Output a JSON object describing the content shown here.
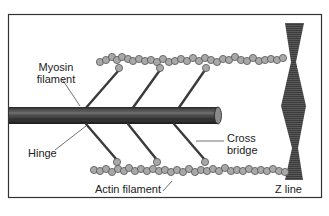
{
  "figure": {
    "labels": {
      "myosin_line1": "Myosin",
      "myosin_line2": "filament",
      "hinge": "Hinge",
      "cross_line1": "Cross",
      "cross_line2": "bridge",
      "actin": "Actin filament",
      "zline": "Z line"
    },
    "colors": {
      "frame": "#333333",
      "rod": "#3a3a3a",
      "rod_highlight": "#6a6a6a",
      "bead_fill": "#a8a8a8",
      "bead_stroke": "#555555",
      "zline": "#3c3c3c",
      "background": "#ffffff"
    }
  }
}
